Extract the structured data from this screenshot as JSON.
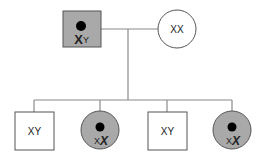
{
  "colors": {
    "affected_fill": "#a9a9a9",
    "unaffected_fill": "#ffffff",
    "dot": "#000000",
    "line": "#8a8a8a"
  },
  "generation_1": {
    "father": {
      "shape": "square",
      "affected": true,
      "carrier_dot": true,
      "label_big": "X",
      "label_small": "Y"
    },
    "mother": {
      "shape": "circle",
      "affected": false,
      "label": "XX"
    }
  },
  "generation_2": {
    "children": [
      {
        "shape": "square",
        "affected": false,
        "label": "XY"
      },
      {
        "shape": "circle",
        "affected": true,
        "carrier_dot": true,
        "label_small": "X",
        "label_big": "X"
      },
      {
        "shape": "square",
        "affected": false,
        "label": "XY"
      },
      {
        "shape": "circle",
        "affected": true,
        "carrier_dot": true,
        "label_small": "X",
        "label_big": "X"
      }
    ]
  }
}
